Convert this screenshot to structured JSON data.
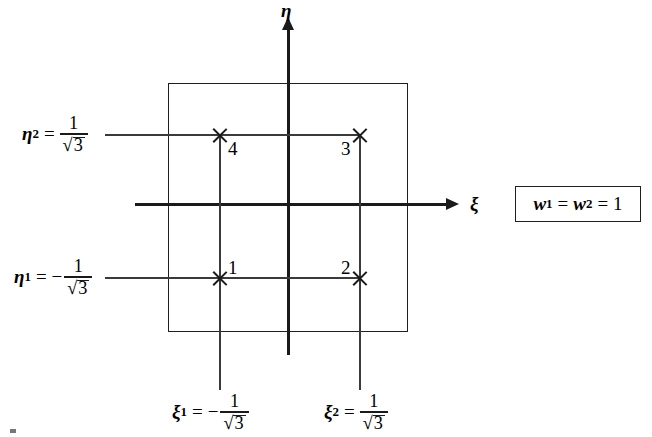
{
  "figure": {
    "background_color": "#ffffff",
    "line_color": "#1a1a1a"
  },
  "axes": {
    "vertical_label": "η",
    "horizontal_label": "ξ",
    "origin": {
      "x": 289,
      "y": 204
    }
  },
  "element": {
    "shape": "square",
    "left": 168,
    "top": 83,
    "right": 408,
    "bottom": 332
  },
  "gauss_points": [
    {
      "number": "1",
      "xi": "-1/√3",
      "eta": "-1/√3",
      "px": 220,
      "py": 278,
      "label_side": "upper-right"
    },
    {
      "number": "2",
      "xi": "1/√3",
      "eta": "-1/√3",
      "px": 360,
      "py": 278,
      "label_side": "upper-left"
    },
    {
      "number": "3",
      "xi": "1/√3",
      "eta": "1/√3",
      "px": 360,
      "py": 135,
      "label_side": "lower-left"
    },
    {
      "number": "4",
      "xi": "-1/√3",
      "eta": "1/√3",
      "px": 220,
      "py": 135,
      "label_side": "lower-right"
    }
  ],
  "eta_labels": [
    {
      "name": "eta2",
      "symbol": "η",
      "subscript": "2",
      "equals": "=",
      "sign": "",
      "numerator": "1",
      "radical": "√",
      "radicand": "3"
    },
    {
      "name": "eta1",
      "symbol": "η",
      "subscript": "1",
      "equals": "=",
      "sign": "−",
      "numerator": "1",
      "radical": "√",
      "radicand": "3"
    }
  ],
  "xi_labels": [
    {
      "name": "xi1",
      "symbol": "ξ",
      "subscript": "1",
      "equals": "=",
      "sign": "−",
      "numerator": "1",
      "radical": "√",
      "radicand": "3"
    },
    {
      "name": "xi2",
      "symbol": "ξ",
      "subscript": "2",
      "equals": "=",
      "sign": "",
      "numerator": "1",
      "radical": "√",
      "radicand": "3"
    }
  ],
  "weights": {
    "w_symbol": "w",
    "sub1": "1",
    "eq1": "=",
    "sub2": "2",
    "eq2": "=",
    "value": "1"
  }
}
